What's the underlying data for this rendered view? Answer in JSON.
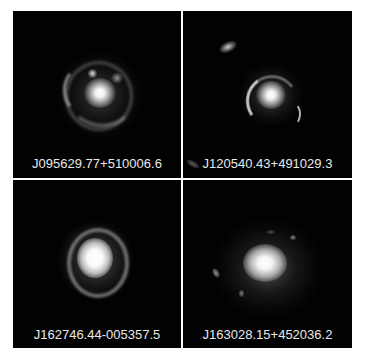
{
  "figure": {
    "background": "#ffffff",
    "panel_background": "#020202",
    "label_color": "#e8e8e8",
    "panels": [
      {
        "label": "J095629.77+510006.6",
        "position": "top-left"
      },
      {
        "label": "J120540.43+491029.3",
        "position": "top-right"
      },
      {
        "label": "J162746.44-005357.5",
        "position": "bottom-left"
      },
      {
        "label": "J163028.15+452036.2",
        "position": "bottom-right"
      }
    ]
  }
}
